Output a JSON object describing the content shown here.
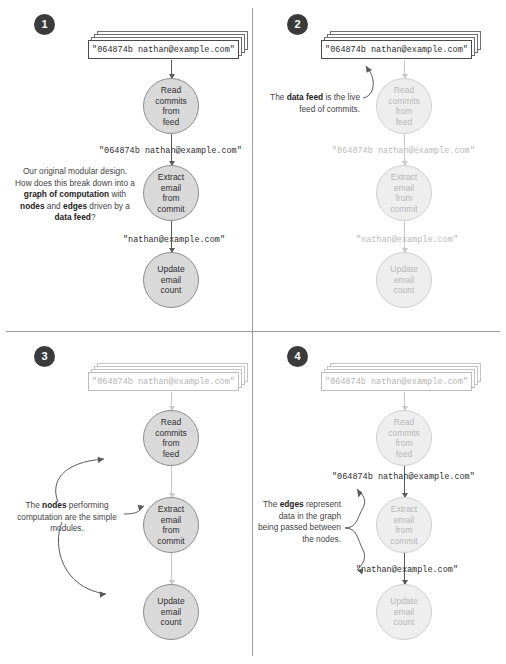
{
  "figure": {
    "feed_text": "\"064874b nathan@example.com\"",
    "edge_label_commit": "\"064874b nathan@example.com\"",
    "edge_label_email": "\"nathan@example.com\"",
    "nodes": [
      {
        "id": "read",
        "lines": [
          "Read",
          "commits",
          "from",
          "feed"
        ]
      },
      {
        "id": "extract",
        "lines": [
          "Extract",
          "email",
          "from",
          "commit"
        ]
      },
      {
        "id": "update",
        "lines": [
          "Update",
          "email",
          "count"
        ]
      }
    ],
    "colors": {
      "node_fill": "#d9d9d9",
      "node_stroke": "#8d8d8d",
      "node_fill_faded": "#eeeeee",
      "badge_bg": "#3b3b3b",
      "text": "#3c3c3c",
      "faded_text": "#b9b9b9",
      "divider": "#9a9a9a"
    }
  },
  "panels": [
    {
      "number": "1",
      "note_parts": [
        {
          "t": "Our original modular design. How does this break down into a ",
          "b": false
        },
        {
          "t": "graph of computation",
          "b": true
        },
        {
          "t": " with ",
          "b": false
        },
        {
          "t": "nodes",
          "b": true
        },
        {
          "t": " and ",
          "b": false
        },
        {
          "t": "edges",
          "b": true
        },
        {
          "t": " driven by a ",
          "b": false
        },
        {
          "t": "data feed",
          "b": true
        },
        {
          "t": "?",
          "b": false
        }
      ],
      "note_plain": "Our original modular design. How does this break down into a graph of computation with nodes and edges driven by a data feed?"
    },
    {
      "number": "2",
      "note_parts": [
        {
          "t": "The ",
          "b": false
        },
        {
          "t": "data feed",
          "b": true
        },
        {
          "t": " is the live feed of commits.",
          "b": false
        }
      ],
      "note_plain": "The data feed is the live feed of commits."
    },
    {
      "number": "3",
      "note_parts": [
        {
          "t": "The ",
          "b": false
        },
        {
          "t": "nodes",
          "b": true
        },
        {
          "t": " performing computation are the simple modules.",
          "b": false
        }
      ],
      "note_plain": "The nodes performing computation are the simple modules."
    },
    {
      "number": "4",
      "note_parts": [
        {
          "t": "The ",
          "b": false
        },
        {
          "t": "edges",
          "b": true
        },
        {
          "t": " represent data in the graph being passed between the nodes.",
          "b": false
        }
      ],
      "note_plain": "The edges represent data in the graph being passed between the nodes."
    }
  ]
}
